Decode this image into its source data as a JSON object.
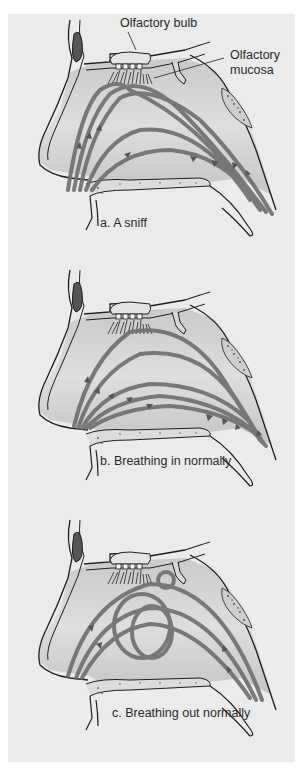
{
  "figure": {
    "panels": [
      {
        "id": "a",
        "caption": "a. A sniff"
      },
      {
        "id": "b",
        "caption": "b. Breathing in normally"
      },
      {
        "id": "c",
        "caption": "c. Breathing out normally"
      }
    ],
    "labels": {
      "olfactory_bulb": "Olfactory bulb",
      "olfactory_mucosa_line1": "Olfactory",
      "olfactory_mucosa_line2": "mucosa"
    },
    "colors": {
      "background": "#ffffff",
      "panel": "#ebebeb",
      "tissue": "#d4d4d4",
      "outline": "#1e1e1e",
      "airflow": "#6e6e6e"
    }
  }
}
